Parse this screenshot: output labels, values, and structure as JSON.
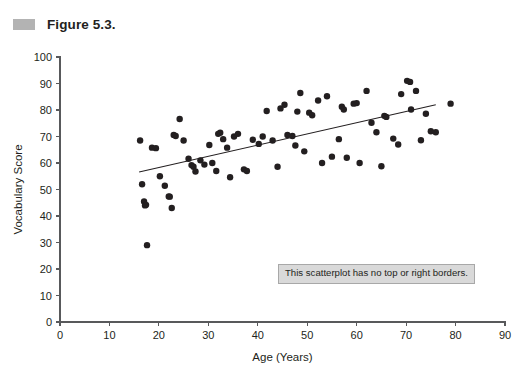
{
  "figure": {
    "marker_icon": "figure-marker-square",
    "title": "Figure 5.3.",
    "marker_color": "#b3b3b3"
  },
  "annotation": {
    "text": "This scatterplot has no top or right borders.",
    "background_color": "#d9d9d9",
    "border_color": "#a8a8a8"
  },
  "chart_data": {
    "type": "scatter",
    "title": "Figure 5.3.",
    "xlabel": "Age (Years)",
    "ylabel": "Vocabulary Score",
    "xlim": [
      0,
      90
    ],
    "ylim": [
      0,
      100
    ],
    "xticks": [
      0,
      10,
      20,
      30,
      40,
      50,
      60,
      70,
      80,
      90
    ],
    "yticks": [
      0,
      10,
      20,
      30,
      40,
      50,
      60,
      70,
      80,
      90,
      100
    ],
    "grid": false,
    "legend": null,
    "point_color": "#231f20",
    "point_size": 3.2,
    "annotations": [
      {
        "text": "This scatterplot has no top or right borders.",
        "x": 44,
        "y": 22
      }
    ],
    "trendline": {
      "type": "linear",
      "x": [
        16,
        76
      ],
      "y": [
        56.6,
        82.0
      ],
      "color": "#231f20"
    },
    "series": [
      {
        "name": "Vocabulary vs Age",
        "points": [
          [
            16.2,
            68.5
          ],
          [
            16.6,
            52.0
          ],
          [
            17.0,
            45.5
          ],
          [
            17.2,
            44.0
          ],
          [
            17.4,
            44.2
          ],
          [
            17.6,
            29.0
          ],
          [
            18.6,
            65.8
          ],
          [
            19.4,
            65.6
          ],
          [
            20.2,
            55.0
          ],
          [
            21.2,
            51.4
          ],
          [
            22.0,
            47.4
          ],
          [
            22.2,
            47.3
          ],
          [
            22.6,
            43.0
          ],
          [
            23.0,
            70.6
          ],
          [
            23.4,
            70.2
          ],
          [
            24.2,
            76.6
          ],
          [
            25.0,
            68.5
          ],
          [
            26.0,
            61.6
          ],
          [
            26.6,
            59.2
          ],
          [
            27.0,
            58.6
          ],
          [
            27.4,
            56.8
          ],
          [
            28.4,
            61.0
          ],
          [
            29.2,
            59.4
          ],
          [
            30.2,
            66.8
          ],
          [
            30.8,
            60.0
          ],
          [
            31.6,
            57.0
          ],
          [
            32.0,
            71.0
          ],
          [
            32.4,
            71.4
          ],
          [
            33.0,
            69.0
          ],
          [
            33.8,
            65.8
          ],
          [
            34.4,
            54.6
          ],
          [
            35.2,
            70.0
          ],
          [
            36.0,
            71.0
          ],
          [
            37.2,
            57.6
          ],
          [
            37.8,
            57.0
          ],
          [
            39.0,
            68.8
          ],
          [
            40.2,
            67.2
          ],
          [
            41.0,
            70.0
          ],
          [
            41.8,
            79.6
          ],
          [
            43.0,
            68.5
          ],
          [
            44.0,
            58.6
          ],
          [
            44.6,
            80.6
          ],
          [
            45.4,
            82.0
          ],
          [
            46.0,
            70.6
          ],
          [
            47.0,
            70.2
          ],
          [
            47.6,
            66.6
          ],
          [
            48.0,
            79.4
          ],
          [
            48.6,
            86.4
          ],
          [
            49.4,
            64.4
          ],
          [
            50.4,
            79.0
          ],
          [
            51.0,
            78.0
          ],
          [
            52.2,
            83.6
          ],
          [
            53.0,
            60.0
          ],
          [
            54.0,
            85.2
          ],
          [
            55.0,
            62.4
          ],
          [
            56.4,
            69.0
          ],
          [
            57.0,
            81.2
          ],
          [
            57.4,
            80.2
          ],
          [
            58.0,
            62.0
          ],
          [
            59.4,
            82.4
          ],
          [
            60.0,
            82.6
          ],
          [
            60.6,
            60.0
          ],
          [
            62.0,
            87.2
          ],
          [
            63.0,
            75.2
          ],
          [
            64.0,
            71.6
          ],
          [
            65.0,
            58.8
          ],
          [
            65.6,
            77.8
          ],
          [
            66.0,
            77.4
          ],
          [
            67.4,
            69.2
          ],
          [
            68.4,
            67.0
          ],
          [
            69.0,
            86.0
          ],
          [
            70.2,
            91.0
          ],
          [
            70.8,
            90.6
          ],
          [
            71.0,
            80.2
          ],
          [
            72.0,
            87.2
          ],
          [
            73.0,
            68.6
          ],
          [
            74.0,
            78.6
          ],
          [
            75.0,
            72.0
          ],
          [
            76.0,
            71.6
          ],
          [
            79.0,
            82.4
          ]
        ]
      }
    ]
  }
}
